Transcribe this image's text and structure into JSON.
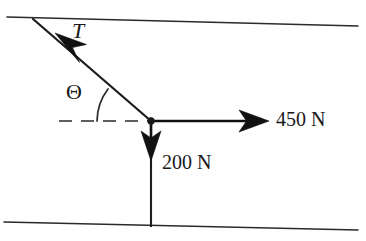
{
  "figure": {
    "kind": "free-body-force-diagram",
    "background_color": "#ffffff",
    "ink_color": "#181818",
    "labels": {
      "tension": "T",
      "angle": "Θ",
      "horizontal_force": "450 N",
      "vertical_force": "200 N"
    },
    "forces": [
      {
        "name": "tension",
        "label": "T",
        "magnitude": null,
        "unit": null,
        "direction": "up-and-to-the-left",
        "angle_label": "Θ"
      },
      {
        "name": "horizontal-force",
        "label": "450 N",
        "magnitude": 450,
        "unit": "N",
        "direction": "right"
      },
      {
        "name": "vertical-force",
        "label": "200 N",
        "magnitude": 200,
        "unit": "N",
        "direction": "down"
      }
    ],
    "geometry": {
      "node": {
        "x": 151,
        "y": 121
      },
      "top_wall": {
        "x1": 7,
        "y1": 17,
        "x2": 358,
        "y2": 26
      },
      "bottom_wall": {
        "x1": 4,
        "y1": 222,
        "x2": 358,
        "y2": 230
      },
      "tension_line": {
        "x1": 151,
        "y1": 121,
        "x2": 33,
        "y2": 19
      },
      "tension_arrow_tip": {
        "x": 55,
        "y": 33
      },
      "horizontal_arrow": {
        "x1": 151,
        "y1": 121,
        "x2": 268,
        "y2": 121
      },
      "vertical_arrow": {
        "x1": 151,
        "y1": 121,
        "x2": 151,
        "y2": 160
      },
      "vertical_rod": {
        "x1": 151,
        "y1": 121,
        "x2": 151,
        "y2": 227
      },
      "dashed_reference": {
        "x1": 60,
        "y1": 121,
        "x2": 151,
        "y2": 121
      },
      "angle_arc_radius": 54
    }
  }
}
